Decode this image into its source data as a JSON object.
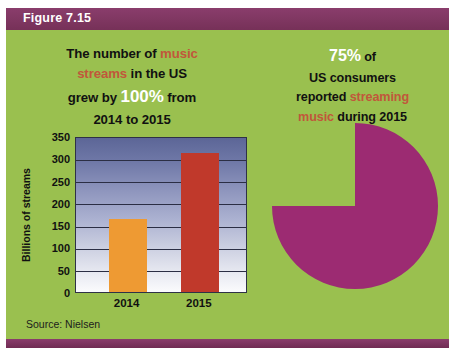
{
  "figure": {
    "label": "Figure 7.15",
    "source": "Source: Nielsen",
    "colors": {
      "panel_green": "#9ac04f",
      "header_purple": "#7d3561",
      "accent_rust": "#c1573b",
      "bar_2014": "#ee9a33",
      "bar_2015": "#c0392b",
      "pie_magenta": "#9c2b72"
    }
  },
  "left_panel": {
    "headline": {
      "line1_a": "The number of ",
      "line1_b": "music",
      "line2_a": "streams",
      "line2_b": " in the US",
      "line3_a": "grew by ",
      "line3_b": "100%",
      "line3_c": " from",
      "line4": "2014 to 2015"
    }
  },
  "right_panel": {
    "headline": {
      "line1_a": "75%",
      "line1_b": " of",
      "line2": "US consumers",
      "line3_a": "reported ",
      "line3_b": "streaming",
      "line4_a": "music",
      "line4_b": " during 2015"
    }
  },
  "chart_data": [
    {
      "type": "bar",
      "title": "",
      "xlabel": "",
      "ylabel": "Billions of streams",
      "categories": [
        "2014",
        "2015"
      ],
      "values": [
        164,
        313
      ],
      "colors": [
        "#ee9a33",
        "#c0392b"
      ],
      "ylim": [
        0,
        350
      ],
      "yticks": [
        0,
        50,
        100,
        150,
        200,
        250,
        300,
        350
      ],
      "ytick_labels": [
        "0",
        "50",
        "100",
        "150",
        "200",
        "250",
        "300",
        "350"
      ],
      "grid": true,
      "legend": "none",
      "source": "Source: Nielsen"
    },
    {
      "type": "pie",
      "title": "",
      "labels": [
        "Reported streaming music",
        "Did not report streaming music"
      ],
      "values": [
        75,
        25
      ],
      "colors": [
        "#9c2b72",
        "#9ac04f"
      ],
      "annotation": "75% of US consumers reported streaming music during 2015",
      "legend": "none"
    }
  ]
}
